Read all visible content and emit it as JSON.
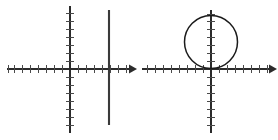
{
  "image": {
    "width": 278,
    "height": 140,
    "background_color": "#ffffff",
    "stroke_color": "#2b2b2b",
    "tick_color": "#4a4a4a",
    "curve_color": "#1b1b1b",
    "panel_count": 2,
    "description": "Two side-by-side cartesian coordinate grids with tick-marked axes"
  },
  "chart_data": [
    {
      "type": "line",
      "title": "",
      "subtitle": "",
      "xlabel": "",
      "ylabel": "",
      "panel": "left",
      "grid": false,
      "legend": "none",
      "axes": {
        "origin_px": [
          70,
          69
        ],
        "x_axis": {
          "start_px": 7,
          "end_px": 135,
          "arrow_right": true,
          "arrow_left": false,
          "tick_spacing_px": 8,
          "ticks_left_of_origin": 8,
          "ticks_right_of_origin": 7,
          "tick_half_length_px": 4,
          "xlim": [
            -8,
            8
          ]
        },
        "y_axis": {
          "start_px": 6,
          "end_px": 133,
          "arrow_top": false,
          "arrow_bottom": false,
          "tick_spacing_px": 8,
          "ticks_above_origin": 7,
          "ticks_below_origin": 7,
          "tick_half_length_px": 4,
          "ylim": [
            -8,
            8
          ]
        }
      },
      "series": [
        {
          "name": "vertical-line",
          "equation": "x = 5",
          "shape": "vertical-segment",
          "x_value": 5,
          "x_px": 109,
          "y_start_px": 10,
          "y_end_px": 125,
          "y_range": [
            -7,
            7.5
          ],
          "color": "#3a3a3a",
          "stroke_width": 2.1
        }
      ],
      "annotations": []
    },
    {
      "type": "line",
      "title": "",
      "subtitle": "",
      "xlabel": "",
      "ylabel": "",
      "panel": "right",
      "grid": false,
      "legend": "none",
      "axes": {
        "origin_px": [
          72,
          69
        ],
        "x_axis": {
          "start_px": 3,
          "end_px": 137,
          "arrow_right": true,
          "arrow_left": false,
          "tick_spacing_px": 8,
          "ticks_left_of_origin": 8,
          "ticks_right_of_origin": 7,
          "tick_half_length_px": 4,
          "xlim": [
            -8,
            8
          ]
        },
        "y_axis": {
          "start_px": 10,
          "end_px": 133,
          "arrow_top": false,
          "arrow_bottom": false,
          "tick_spacing_px": 8,
          "ticks_above_origin": 7,
          "ticks_below_origin": 7,
          "tick_half_length_px": 4,
          "ylim": [
            -8,
            8
          ]
        }
      },
      "series": [
        {
          "name": "circle",
          "equation": "x^2 + (y - 3.25)^2 = 3.25^2",
          "shape": "circle",
          "center_px": [
            72,
            42
          ],
          "center_units": [
            0,
            3.25
          ],
          "radius_px": 26.5,
          "radius_units": 3.25,
          "tangent_to_x_axis_at_origin": true,
          "color": "#1b1b1b",
          "stroke_width": 1.5
        }
      ],
      "annotations": []
    }
  ]
}
